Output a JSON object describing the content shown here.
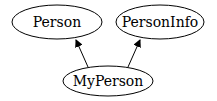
{
  "diagram": {
    "type": "inheritance-graph",
    "nodes": [
      {
        "id": "person",
        "label": "Person",
        "cx": 57,
        "cy": 22,
        "rx": 45,
        "ry": 17
      },
      {
        "id": "personinfo",
        "label": "PersonInfo",
        "cx": 160,
        "cy": 22,
        "rx": 44,
        "ry": 17
      },
      {
        "id": "myperson",
        "label": "MyPerson",
        "cx": 108,
        "cy": 81,
        "rx": 45,
        "ry": 15
      }
    ],
    "edges": [
      {
        "from": "myperson",
        "to": "person"
      },
      {
        "from": "myperson",
        "to": "personinfo"
      }
    ],
    "colors": {
      "stroke": "#000000",
      "background": "#ffffff"
    }
  }
}
